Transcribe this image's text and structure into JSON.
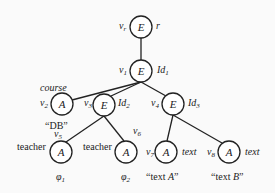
{
  "diagram": {
    "nodes": [
      {
        "id": "vr",
        "label": "E",
        "name": "v_r",
        "name_main": "v",
        "name_sub": "r",
        "attr": "r",
        "attr_main": "r",
        "attr_sub": ""
      },
      {
        "id": "v1",
        "label": "E",
        "name": "v_1",
        "name_main": "v",
        "name_sub": "1",
        "attr": "Id_1",
        "attr_main": "Id",
        "attr_sub": "1"
      },
      {
        "id": "v2",
        "label": "A",
        "name": "v_2",
        "name_main": "v",
        "name_sub": "2",
        "attr": "course",
        "value": "“DB”"
      },
      {
        "id": "v3",
        "label": "E",
        "name": "v_3",
        "name_main": "v",
        "name_sub": "3",
        "attr": "Id_2",
        "attr_main": "Id",
        "attr_sub": "2"
      },
      {
        "id": "v4",
        "label": "E",
        "name": "v_4",
        "name_main": "v",
        "name_sub": "4",
        "attr": "Id_3",
        "attr_main": "Id",
        "attr_sub": "3"
      },
      {
        "id": "v5",
        "label": "A",
        "name": "v_5",
        "name_main": "v",
        "name_sub": "5",
        "attr": "teacher",
        "value_main": "φ",
        "value_sub": "1"
      },
      {
        "id": "v6",
        "label": "A",
        "name": "v_6",
        "name_main": "v",
        "name_sub": "6",
        "attr": "teacher",
        "value_main": "φ",
        "value_sub": "2"
      },
      {
        "id": "v7",
        "label": "A",
        "name": "v_7",
        "name_main": "v",
        "name_sub": "7",
        "attr": "text",
        "value": "“text A”",
        "value_pre": "“text ",
        "value_it": "A",
        "value_post": "”"
      },
      {
        "id": "v8",
        "label": "A",
        "name": "v_8",
        "name_main": "v",
        "name_sub": "8",
        "attr": "text",
        "value": "“text B”",
        "value_pre": "“text ",
        "value_it": "B",
        "value_post": "”"
      }
    ],
    "edges": [
      [
        "vr",
        "v1"
      ],
      [
        "v1",
        "v2"
      ],
      [
        "v1",
        "v3"
      ],
      [
        "v1",
        "v4"
      ],
      [
        "v3",
        "v5"
      ],
      [
        "v3",
        "v6"
      ],
      [
        "v4",
        "v7"
      ],
      [
        "v4",
        "v8"
      ]
    ]
  }
}
